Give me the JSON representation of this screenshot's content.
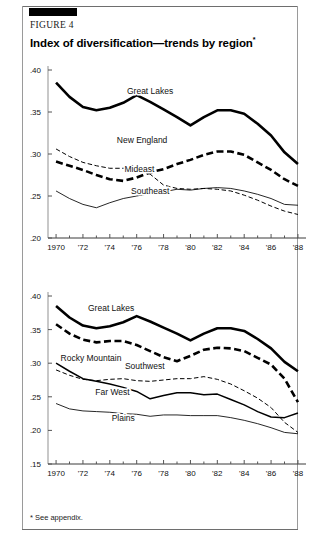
{
  "figure": {
    "label": "FIGURE 4",
    "title": "Index of diversification—trends by region",
    "title_marker": "*",
    "footnote": "* See appendix."
  },
  "chart_data": [
    {
      "id": "top",
      "type": "line",
      "title": "Index of diversification—trends by region (panel 1)",
      "xlabel": "",
      "ylabel": "",
      "x": [
        1970,
        1971,
        1972,
        1973,
        1974,
        1975,
        1976,
        1977,
        1978,
        1979,
        1980,
        1981,
        1982,
        1983,
        1984,
        1985,
        1986,
        1987,
        1988
      ],
      "xlim": [
        1969.4,
        1988.6
      ],
      "ylim": [
        0.2,
        0.4
      ],
      "xtick_values": [
        1970,
        1972,
        1974,
        1976,
        1978,
        1980,
        1982,
        1984,
        1986,
        1988
      ],
      "xtick_labels": [
        "1970",
        "'72",
        "'74",
        "'76",
        "'78",
        "'80",
        "'82",
        "'84",
        "'86",
        "'88"
      ],
      "ytick_values": [
        0.2,
        0.25,
        0.3,
        0.35,
        0.4
      ],
      "ytick_labels": [
        ".20",
        ".25",
        ".30",
        ".35",
        ".40"
      ],
      "grid": false,
      "legend_position": "inline-annotations",
      "series": [
        {
          "name": "Great Lakes",
          "style": "thick-solid",
          "label_x": 1977.0,
          "label_y": 0.372,
          "values": [
            0.385,
            0.368,
            0.356,
            0.352,
            0.355,
            0.361,
            0.37,
            0.362,
            0.353,
            0.344,
            0.334,
            0.344,
            0.352,
            0.352,
            0.348,
            0.336,
            0.322,
            0.302,
            0.288
          ]
        },
        {
          "name": "New England",
          "style": "thick-dashed",
          "label_x": 1976.4,
          "label_y": 0.313,
          "values": [
            0.291,
            0.286,
            0.281,
            0.275,
            0.27,
            0.268,
            0.272,
            0.278,
            0.282,
            0.288,
            0.293,
            0.299,
            0.303,
            0.303,
            0.299,
            0.29,
            0.281,
            0.27,
            0.262
          ]
        },
        {
          "name": "Mideast",
          "style": "thin-dashed",
          "label_x": 1976.2,
          "label_y": 0.279,
          "values": [
            0.306,
            0.297,
            0.29,
            0.286,
            0.283,
            0.283,
            0.283,
            0.276,
            0.263,
            0.259,
            0.258,
            0.259,
            0.258,
            0.256,
            0.251,
            0.245,
            0.238,
            0.232,
            0.228
          ]
        },
        {
          "name": "Southeast",
          "style": "thin-solid",
          "label_x": 1977.0,
          "label_y": 0.252,
          "values": [
            0.256,
            0.247,
            0.24,
            0.236,
            0.242,
            0.247,
            0.25,
            0.253,
            0.255,
            0.258,
            0.257,
            0.259,
            0.26,
            0.259,
            0.256,
            0.252,
            0.247,
            0.24,
            0.239
          ]
        }
      ]
    },
    {
      "id": "bottom",
      "type": "line",
      "title": "Index of diversification—trends by region (panel 2)",
      "xlabel": "",
      "ylabel": "",
      "x": [
        1970,
        1971,
        1972,
        1973,
        1974,
        1975,
        1976,
        1977,
        1978,
        1979,
        1980,
        1981,
        1982,
        1983,
        1984,
        1985,
        1986,
        1987,
        1988
      ],
      "xlim": [
        1969.4,
        1988.6
      ],
      "ylim": [
        0.15,
        0.4
      ],
      "xtick_values": [
        1970,
        1972,
        1974,
        1976,
        1978,
        1980,
        1982,
        1984,
        1986,
        1988
      ],
      "xtick_labels": [
        "1970",
        "'72",
        "'74",
        "'76",
        "'78",
        "'80",
        "'82",
        "'84",
        "'86",
        "'88"
      ],
      "ytick_values": [
        0.15,
        0.2,
        0.25,
        0.3,
        0.35,
        0.4
      ],
      "ytick_labels": [
        ".15",
        ".20",
        ".25",
        ".30",
        ".35",
        ".40"
      ],
      "grid": false,
      "legend_position": "inline-annotations",
      "series": [
        {
          "name": "Great Lakes",
          "style": "thick-solid",
          "label_x": 1974.1,
          "label_y": 0.378,
          "values": [
            0.385,
            0.368,
            0.356,
            0.352,
            0.355,
            0.361,
            0.37,
            0.362,
            0.353,
            0.344,
            0.334,
            0.344,
            0.352,
            0.352,
            0.348,
            0.336,
            0.322,
            0.302,
            0.288
          ]
        },
        {
          "name": "Rocky Mountain",
          "style": "thick-dashed",
          "label_x": 1972.6,
          "label_y": 0.303,
          "values": [
            0.358,
            0.344,
            0.335,
            0.331,
            0.333,
            0.333,
            0.327,
            0.318,
            0.309,
            0.303,
            0.311,
            0.32,
            0.323,
            0.322,
            0.318,
            0.308,
            0.298,
            0.277,
            0.242
          ]
        },
        {
          "name": "Southwest",
          "style": "thin-dashed",
          "label_x": 1976.6,
          "label_y": 0.291,
          "values": [
            0.29,
            0.282,
            0.276,
            0.274,
            0.276,
            0.277,
            0.274,
            0.273,
            0.275,
            0.277,
            0.277,
            0.28,
            0.276,
            0.269,
            0.259,
            0.248,
            0.234,
            0.212,
            0.197
          ]
        },
        {
          "name": "Far West",
          "style": "medium-solid",
          "label_x": 1974.2,
          "label_y": 0.252,
          "values": [
            0.3,
            0.288,
            0.277,
            0.273,
            0.269,
            0.264,
            0.258,
            0.247,
            0.252,
            0.256,
            0.256,
            0.253,
            0.254,
            0.246,
            0.238,
            0.228,
            0.22,
            0.219,
            0.226
          ]
        },
        {
          "name": "Plains",
          "style": "thin-solid",
          "label_x": 1975.0,
          "label_y": 0.214,
          "values": [
            0.24,
            0.232,
            0.229,
            0.228,
            0.227,
            0.225,
            0.224,
            0.221,
            0.223,
            0.223,
            0.222,
            0.222,
            0.222,
            0.219,
            0.215,
            0.21,
            0.204,
            0.197,
            0.195
          ]
        }
      ]
    }
  ]
}
